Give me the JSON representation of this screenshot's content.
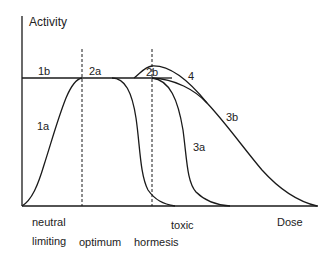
{
  "diagram": {
    "type": "dose-response",
    "y_axis_label": "Activity",
    "x_axis_label": "Dose",
    "curve_labels": {
      "c1a": "1a",
      "c1b": "1b",
      "c2a": "2a",
      "c2b": "2b",
      "c3a": "3a",
      "c3b": "3b",
      "c4": "4"
    },
    "zones": {
      "neutral": "neutral",
      "limiting": "limiting",
      "optimum": "optimum",
      "hormesis": "hormesis",
      "toxic": "toxic"
    },
    "colors": {
      "line": "#1a1a1a",
      "background": "#ffffff"
    }
  }
}
